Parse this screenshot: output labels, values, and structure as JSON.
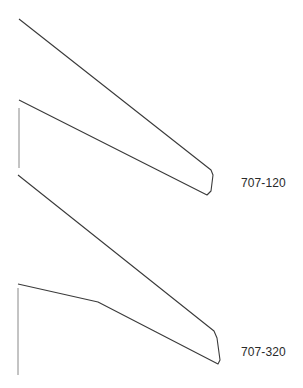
{
  "diagram": {
    "type": "wing-planform-comparison",
    "stroke_color": "#3a3a3a",
    "centerline_color": "#6a6a6a",
    "background": "#ffffff",
    "wings": [
      {
        "id": "707-120",
        "label": "707-120",
        "outline": [
          [
            19,
            19
          ],
          [
            211,
            170
          ],
          [
            213,
            175
          ],
          [
            211,
            191
          ],
          [
            207,
            195
          ],
          [
            19,
            100
          ]
        ],
        "centerline": [
          [
            19,
            108
          ],
          [
            19,
            168
          ]
        ],
        "label_pos": [
          241,
          176
        ]
      },
      {
        "id": "707-320",
        "label": "707-320",
        "outline": [
          [
            18,
            175
          ],
          [
            214,
            331
          ],
          [
            217,
            338
          ],
          [
            220,
            360
          ],
          [
            218,
            364
          ],
          [
            98,
            302
          ],
          [
            18,
            284
          ]
        ],
        "centerline": [
          [
            18,
            288
          ],
          [
            18,
            375
          ]
        ],
        "label_pos": [
          241,
          345
        ]
      }
    ]
  }
}
